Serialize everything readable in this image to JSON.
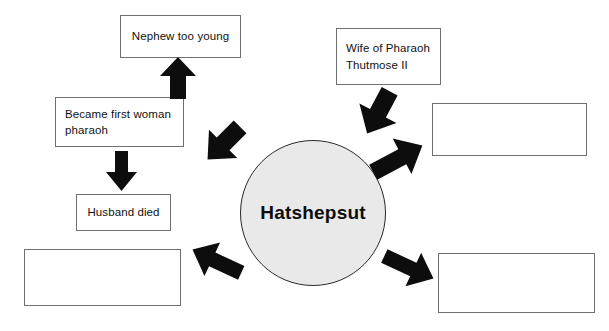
{
  "diagram": {
    "title_node": {
      "label": "Hatshepsut",
      "shape": "circle",
      "fill_color": "#e9e9e9",
      "border_color": "#2a2a2a"
    },
    "nodes": [
      {
        "id": "nephew",
        "label": "Nephew too young",
        "filled": true
      },
      {
        "id": "became-pharaoh",
        "label": "Became first woman\npharaoh",
        "filled": true
      },
      {
        "id": "husband-died",
        "label": "Husband died",
        "filled": true
      },
      {
        "id": "wife-thutmose",
        "label": "Wife of Pharaoh\nThutmose II",
        "filled": true
      },
      {
        "id": "blank-right",
        "label": "",
        "filled": false
      },
      {
        "id": "blank-bottom-left",
        "label": "",
        "filled": false
      },
      {
        "id": "blank-bottom-right",
        "label": "",
        "filled": false
      }
    ],
    "arrows": [
      {
        "id": "arrow-up-to-nephew",
        "direction": "up",
        "color": "#0d0d0d"
      },
      {
        "id": "arrow-down-to-husband-died",
        "direction": "down",
        "color": "#0d0d0d"
      },
      {
        "id": "arrow-center-to-became-pharaoh",
        "direction": "up-left",
        "color": "#0d0d0d"
      },
      {
        "id": "arrow-center-to-wife-thutmose",
        "direction": "up-left",
        "color": "#0d0d0d"
      },
      {
        "id": "arrow-center-to-blank-right",
        "direction": "up-right",
        "color": "#0d0d0d"
      },
      {
        "id": "arrow-center-to-blank-bottom-left",
        "direction": "down-left",
        "color": "#0d0d0d"
      },
      {
        "id": "arrow-center-to-blank-bottom-right",
        "direction": "down-right",
        "color": "#0d0d0d"
      }
    ]
  }
}
